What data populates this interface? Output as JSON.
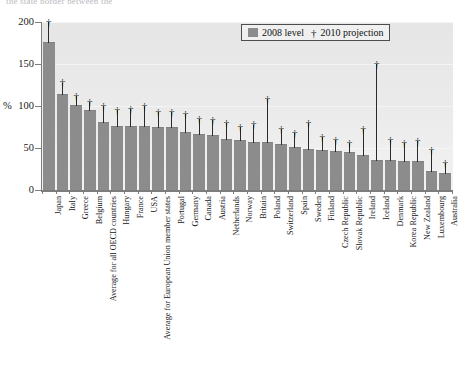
{
  "caption": {
    "cutoff_text": "the state border between the"
  },
  "legend": {
    "position": "top-right",
    "items": [
      {
        "marker": "gray-square-swatch",
        "label": "2008 level"
      },
      {
        "marker": "dagger-glyph",
        "glyph": "†",
        "label": "2010 projection"
      }
    ]
  },
  "axis": {
    "y_unit": "%",
    "y_ticks": [
      "0",
      "50",
      "100",
      "150",
      "200"
    ]
  },
  "colors": {
    "bar": "#8c8c8c",
    "plot_background": "#ebebeb",
    "axis": "#7d7d7d",
    "projection_marker": "#1a1a1a",
    "legend_border": "#4d4d4d"
  },
  "chart_data": {
    "type": "bar",
    "title": "",
    "subtitle": "",
    "xlabel": "",
    "ylabel": "%",
    "ylim": [
      0,
      200
    ],
    "yticks": [
      0,
      50,
      100,
      150,
      200
    ],
    "grid": true,
    "legend_position": "top-right",
    "categories": [
      "Japan",
      "Italy",
      "Greece",
      "Belgium",
      "Average for all OECD countries",
      "Hungary",
      "France",
      "USA",
      "Average for European Union member states",
      "Portugal",
      "Germany",
      "Canada",
      "Austria",
      "Netherlands",
      "Norway",
      "Britain",
      "Poland",
      "Switzerland",
      "Spain",
      "Sweden",
      "Finland",
      "Czech Republic",
      "Slovak Republic",
      "Ireland",
      "Iceland",
      "Denmark",
      "Korea Republic",
      "New Zealand",
      "Luxembourg",
      "Australia"
    ],
    "series": [
      {
        "name": "2008 level",
        "type": "bar",
        "values": [
          175,
          113,
          100,
          94,
          80,
          75,
          75,
          75,
          74,
          74,
          68,
          65,
          64,
          60,
          58,
          56,
          56,
          53,
          50,
          48,
          47,
          45,
          44,
          41,
          35,
          35,
          33,
          33,
          22,
          19
        ]
      },
      {
        "name": "2010 projection",
        "type": "marker",
        "glyph": "†",
        "values": [
          200,
          128,
          112,
          105,
          100,
          95,
          97,
          100,
          93,
          93,
          90,
          85,
          83,
          80,
          75,
          78,
          108,
          73,
          68,
          80,
          63,
          60,
          56,
          73,
          150,
          60,
          56,
          58,
          48,
          32
        ]
      }
    ]
  }
}
